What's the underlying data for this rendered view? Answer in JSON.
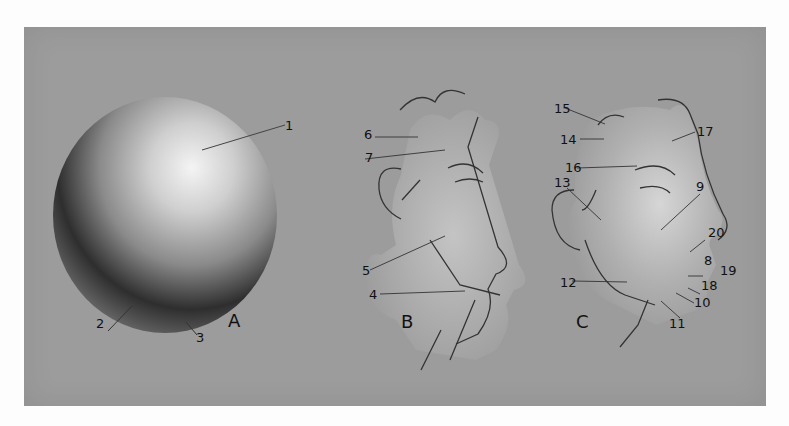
{
  "plate": {
    "background_color": "#9c9c9c",
    "figures": [
      {
        "letter": "A",
        "subject": "sphere",
        "labels": [
          "1",
          "2",
          "3"
        ]
      },
      {
        "letter": "B",
        "subject": "head-profile-simple",
        "labels": [
          "4",
          "5",
          "6",
          "7"
        ]
      },
      {
        "letter": "C",
        "subject": "head-profile-detailed",
        "labels": [
          "8",
          "9",
          "10",
          "11",
          "12",
          "13",
          "14",
          "15",
          "16",
          "17",
          "18",
          "19",
          "20"
        ]
      }
    ]
  },
  "letters": {
    "a": "A",
    "b": "B",
    "c": "C"
  },
  "labels": {
    "l1": "1",
    "l2": "2",
    "l3": "3",
    "l4": "4",
    "l5": "5",
    "l6": "6",
    "l7": "7",
    "l8": "8",
    "l9": "9",
    "l10": "10",
    "l11": "11",
    "l12": "12",
    "l13": "13",
    "l14": "14",
    "l15": "15",
    "l16": "16",
    "l17": "17",
    "l18": "18",
    "l19": "19",
    "l20": "20"
  }
}
